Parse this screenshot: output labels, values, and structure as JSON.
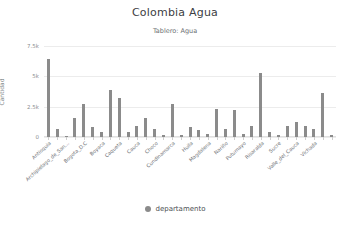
{
  "chart_data": {
    "type": "bar",
    "title": "Colombia Agua",
    "subtitle": "Tablero: Agua",
    "xlabel": "",
    "ylabel": "Cantidad",
    "ylim": [
      0,
      7500
    ],
    "yticks": [
      "0",
      "2.5k",
      "5k",
      "7.5k"
    ],
    "ytick_values": [
      0,
      2500,
      5000,
      7500
    ],
    "grid": true,
    "legend": {
      "position": "bottom",
      "entries": [
        {
          "label": "departamento",
          "color": "#8b8b8b"
        }
      ]
    },
    "series_color": "#8b8b8b",
    "categories": [
      "Antioquia",
      "Archipielago_de_San...",
      "Bogota_D.C",
      "Boyaca",
      "Caqueta",
      "Cauca",
      "Choco",
      "Cundinamarca",
      "Huila",
      "Magdalena",
      "Nariño",
      "Putumayo",
      "Risaralda",
      "Sucre",
      "Valle_del_Cauca",
      "Vichada"
    ],
    "bars": [
      {
        "value": 6400
      },
      {
        "value": 700
      },
      {
        "value": 120
      },
      {
        "value": 1550
      },
      {
        "value": 2750
      },
      {
        "value": 800
      },
      {
        "value": 450
      },
      {
        "value": 3900
      },
      {
        "value": 3200
      },
      {
        "value": 380
      },
      {
        "value": 900
      },
      {
        "value": 1600
      },
      {
        "value": 700
      },
      {
        "value": 140
      },
      {
        "value": 2700
      },
      {
        "value": 160
      },
      {
        "value": 800
      },
      {
        "value": 600
      },
      {
        "value": 260
      },
      {
        "value": 2300
      },
      {
        "value": 620
      },
      {
        "value": 2250
      },
      {
        "value": 240
      },
      {
        "value": 900
      },
      {
        "value": 5300
      },
      {
        "value": 430
      },
      {
        "value": 150
      },
      {
        "value": 880
      },
      {
        "value": 1250
      },
      {
        "value": 900
      },
      {
        "value": 700
      },
      {
        "value": 3650
      },
      {
        "value": 130
      }
    ]
  }
}
